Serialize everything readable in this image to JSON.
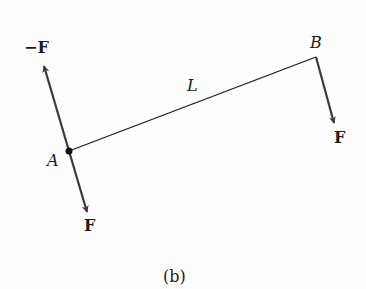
{
  "figure": {
    "caption": "(b)",
    "labels": {
      "neg_force": "−F",
      "point_a": "A",
      "force_a": "F",
      "length": "L",
      "point_b": "B",
      "force_b": "F"
    },
    "colors": {
      "line": "#1a1a1a",
      "arrow": "#3a3a3a"
    }
  }
}
